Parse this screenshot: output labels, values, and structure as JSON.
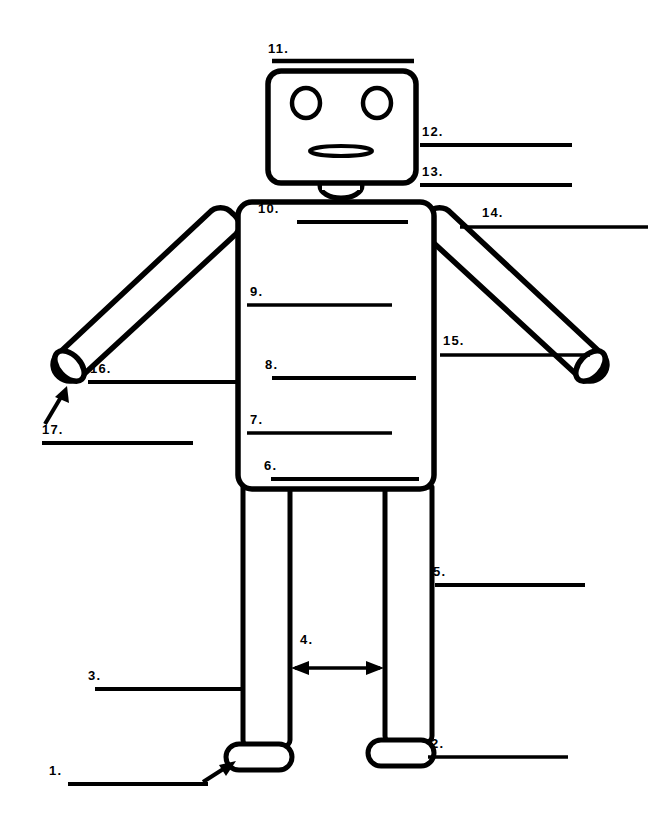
{
  "worksheet": {
    "title": "Robot Body Parts Labeling Worksheet",
    "background_color": "#ffffff",
    "ink_color": "#000000",
    "width": 660,
    "height": 828
  },
  "figure": {
    "name": "robot",
    "parts": [
      "head",
      "left-eye",
      "right-eye",
      "mouth",
      "neck",
      "torso",
      "left-arm",
      "right-arm",
      "left-hand",
      "right-hand",
      "left-leg",
      "right-leg",
      "left-foot",
      "right-foot"
    ]
  },
  "labels": [
    {
      "id": 1,
      "text": "1.",
      "pointer": "arrow",
      "target": "left-foot"
    },
    {
      "id": 2,
      "text": "2.",
      "pointer": "line",
      "target": "right-foot"
    },
    {
      "id": 3,
      "text": "3.",
      "pointer": "line",
      "target": "left-leg"
    },
    {
      "id": 4,
      "text": "4.",
      "pointer": "double-arrow",
      "target": "gap-between-legs"
    },
    {
      "id": 5,
      "text": "5.",
      "pointer": "line",
      "target": "right-leg"
    },
    {
      "id": 6,
      "text": "6.",
      "pointer": "line",
      "target": "torso-bottom"
    },
    {
      "id": 7,
      "text": "7.",
      "pointer": "line",
      "target": "torso-lower"
    },
    {
      "id": 8,
      "text": "8.",
      "pointer": "line",
      "target": "torso-middle"
    },
    {
      "id": 9,
      "text": "9.",
      "pointer": "line",
      "target": "torso-upper"
    },
    {
      "id": 10,
      "text": "10.",
      "pointer": "line",
      "target": "torso-top"
    },
    {
      "id": 11,
      "text": "11.",
      "pointer": "line",
      "target": "head"
    },
    {
      "id": 12,
      "text": "12.",
      "pointer": "line",
      "target": "mouth"
    },
    {
      "id": 13,
      "text": "13.",
      "pointer": "line",
      "target": "neck"
    },
    {
      "id": 14,
      "text": "14.",
      "pointer": "line",
      "target": "right-shoulder"
    },
    {
      "id": 15,
      "text": "15.",
      "pointer": "line",
      "target": "right-hand"
    },
    {
      "id": 16,
      "text": "16.",
      "pointer": "line",
      "target": "left-hand"
    },
    {
      "id": 17,
      "text": "17.",
      "pointer": "arrow",
      "target": "left-hand-tip"
    }
  ]
}
